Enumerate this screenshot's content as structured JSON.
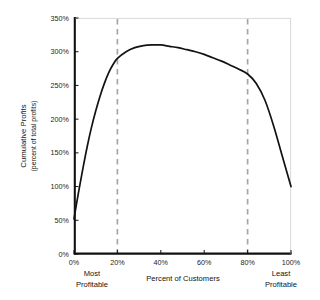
{
  "chart_data": {
    "type": "line",
    "title": "",
    "xlabel": "Percent of Customers",
    "ylabel": "Cumulative Profits",
    "ylabel_sub": "(percent of total profits)",
    "xlim": [
      0,
      100
    ],
    "ylim": [
      0,
      350
    ],
    "grid": false,
    "legend": "none",
    "x_tick_labels": [
      "0%",
      "20%",
      "40%",
      "60%",
      "80%",
      "100%"
    ],
    "x_tick_values": [
      0,
      20,
      40,
      60,
      80,
      100
    ],
    "y_tick_labels": [
      "0%",
      "50%",
      "100%",
      "150%",
      "200%",
      "250%",
      "300%",
      "350%"
    ],
    "y_tick_values": [
      0,
      50,
      100,
      150,
      200,
      250,
      300,
      350
    ],
    "annotations": {
      "left_corner": "Most Profitable",
      "left_corner_line1": "Most",
      "left_corner_line2": "Profitable",
      "right_corner": "Least Profitable",
      "right_corner_line1": "Least",
      "right_corner_line2": "Profitable"
    },
    "reference_lines": [
      {
        "name": "top-20-percent",
        "x": 20,
        "style": "dashed",
        "color": "#a6a6a6"
      },
      {
        "name": "bottom-20-percent",
        "x": 80,
        "style": "dashed",
        "color": "#a6a6a6"
      }
    ],
    "series": [
      {
        "name": "Cumulative Profits",
        "color": "#121212",
        "x": [
          0,
          2,
          4,
          6,
          8,
          10,
          12,
          14,
          16,
          18,
          20,
          24,
          28,
          32,
          36,
          40,
          44,
          48,
          52,
          56,
          60,
          64,
          68,
          72,
          76,
          80,
          84,
          88,
          92,
          96,
          100
        ],
        "values": [
          52,
          90,
          125,
          158,
          187,
          212,
          234,
          253,
          269,
          281,
          290,
          300,
          306,
          309,
          310,
          310,
          308,
          306,
          303,
          300,
          296,
          291,
          286,
          280,
          274,
          267,
          253,
          228,
          190,
          145,
          100
        ]
      }
    ]
  },
  "figure": {
    "plot_left": 74,
    "plot_right": 291,
    "plot_top": 18,
    "plot_bottom": 254
  }
}
